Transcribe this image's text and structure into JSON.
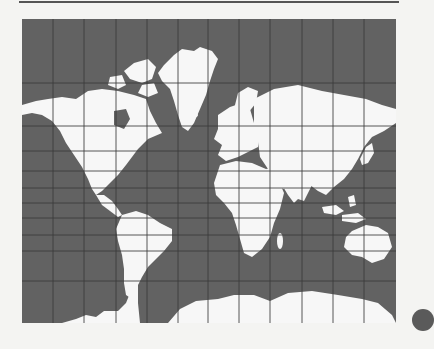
{
  "map": {
    "projection": "mercator-world",
    "colors": {
      "ocean": "#626262",
      "land": "#f7f7f7",
      "grid": "#3a3a3a",
      "grid_on_land": "#bdbdbd",
      "page": "#f4f4f2"
    },
    "grid": {
      "columns": 12,
      "vertical_lines_x": [
        31,
        62,
        94,
        125,
        156,
        186,
        217,
        248,
        280,
        311,
        342
      ],
      "horizontal_lines_y": [
        64,
        107,
        132,
        152,
        169,
        184,
        199,
        216,
        232,
        262
      ]
    },
    "regions": [
      "north-america",
      "greenland",
      "south-america",
      "europe",
      "africa",
      "asia",
      "australia",
      "antarctica"
    ]
  },
  "decorations": {
    "top_rule": "horizontal-line",
    "edge_circle": "partial-dark-circle"
  }
}
